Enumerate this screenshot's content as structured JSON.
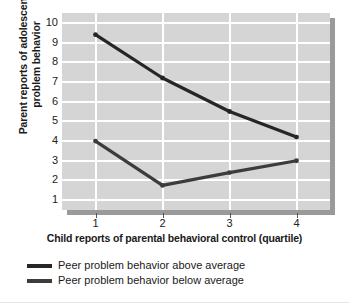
{
  "chart_data": {
    "type": "line",
    "title": "",
    "xlabel": "Child reports of parental behavioral control (quartile)",
    "ylabel": "Parent reports of adolescent problem behavior",
    "ylabel_line1": "Parent reports of adolescent",
    "ylabel_line2": "problem behavior",
    "x": [
      1,
      2,
      3,
      4
    ],
    "xticklabels": [
      "1",
      "2",
      "3",
      "4"
    ],
    "yticklabels": [
      "10",
      "9",
      "8",
      "7",
      "6",
      "5",
      "4",
      "3",
      "2",
      "1"
    ],
    "ylim": [
      0.5,
      10.5
    ],
    "yticks": [
      1,
      2,
      3,
      4,
      5,
      6,
      7,
      8,
      9,
      10
    ],
    "xlim": [
      0.5,
      4.5
    ],
    "grid": "white gridlines on gray panel, horizontal and vertical",
    "legend_position": "below plot, left aligned",
    "series": [
      {
        "name": "Peer problem behavior above average",
        "values": [
          9.4,
          7.2,
          5.5,
          4.2
        ],
        "color": "#262626"
      },
      {
        "name": "Peer problem behavior below average",
        "values": [
          4.0,
          1.75,
          2.4,
          3.0
        ],
        "color": "#3c3c3c"
      }
    ]
  },
  "legend": {
    "items": [
      {
        "label": "Peer problem behavior above average"
      },
      {
        "label": "Peer problem behavior below average"
      }
    ]
  },
  "colors": {
    "panel": "#d5d5d5",
    "gridline": "#ffffff",
    "shadow": "#9a9a9a",
    "series_above": "#262626",
    "series_below": "#3c3c3c",
    "text": "#1a1a1a"
  }
}
